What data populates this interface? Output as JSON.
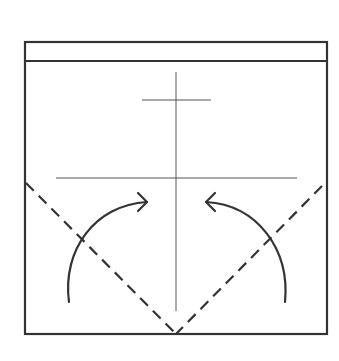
{
  "diagram": {
    "title": "",
    "colors": {
      "stroke": "#333333",
      "crease": "#555555",
      "background": "#ffffff"
    },
    "paper": {
      "x": 25,
      "y": 42,
      "width": 302,
      "height": 292
    },
    "top_strip_line_y": 61,
    "crease_vertical": {
      "x": 176,
      "y1": 72,
      "y2": 311
    },
    "crease_short_horizontal": {
      "y": 100,
      "x1": 142,
      "x2": 211
    },
    "crease_long_horizontal": {
      "y": 178,
      "x1": 56,
      "x2": 297
    },
    "fold_lines": [
      {
        "name": "left-valley-fold",
        "x1": 25,
        "y1": 182,
        "x2": 176,
        "y2": 334
      },
      {
        "name": "right-valley-fold",
        "x1": 322,
        "y1": 185,
        "x2": 176,
        "y2": 334
      }
    ],
    "arrows": [
      {
        "name": "left-fold-arrow",
        "from": [
          69,
          302
        ],
        "to": [
          147,
          202
        ],
        "direction": "right"
      },
      {
        "name": "right-fold-arrow",
        "from": [
          285,
          302
        ],
        "to": [
          206,
          202
        ],
        "direction": "left"
      }
    ]
  }
}
